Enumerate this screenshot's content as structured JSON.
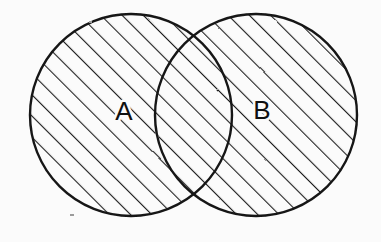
{
  "figure": {
    "kind": "venn-diagram",
    "title": "",
    "caption": "",
    "width": 381,
    "height": 242,
    "background_color": "#fbfbfb",
    "style": "hand-drawn scanned line art",
    "shaded_region_description": "union of A and B (both circles fully hatched)"
  },
  "palette": {
    "ink": "#111111",
    "outline": "#161616",
    "hatch": "#1d1d1d",
    "paper": "#fbfbfb"
  },
  "hatching": {
    "angle_degrees": 45,
    "direction": "lower-left to upper-right",
    "spacing_px": 15,
    "stroke_width_px": 2.2,
    "color": "#1d1d1d"
  },
  "sets": [
    {
      "id": "A",
      "label": "A",
      "label_x": 124,
      "label_y": 113,
      "center_x": 131,
      "center_y": 115,
      "radius": 101,
      "shaded": true,
      "outline_width_px": 2.4
    },
    {
      "id": "B",
      "label": "B",
      "label_x": 262,
      "label_y": 112,
      "center_x": 256,
      "center_y": 115,
      "radius": 101,
      "shaded": true,
      "outline_width_px": 2.4
    }
  ],
  "intersection": {
    "label": "",
    "shaded": true,
    "top_point_x": 193,
    "top_point_y": 40,
    "bottom_point_x": 193,
    "bottom_point_y": 190
  },
  "artifacts": [
    {
      "name": "speck",
      "x": 70,
      "y": 214,
      "width": 4,
      "height": 2
    },
    {
      "name": "speck",
      "x": 89,
      "y": 21,
      "width": 3,
      "height": 2
    }
  ]
}
